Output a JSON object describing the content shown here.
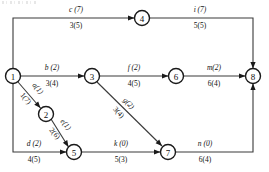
{
  "diagram": {
    "type": "activity-on-arrow-network",
    "title": "",
    "nodes": [
      {
        "id": "1",
        "label": "1",
        "cx": 13,
        "cy": 76,
        "r": 7.5
      },
      {
        "id": "2",
        "label": "2",
        "cx": 46,
        "cy": 114,
        "r": 7.5
      },
      {
        "id": "3",
        "label": "3",
        "cx": 92,
        "cy": 76,
        "r": 7.5
      },
      {
        "id": "4",
        "label": "4",
        "cx": 142,
        "cy": 18,
        "r": 7.5
      },
      {
        "id": "5",
        "label": "5",
        "cx": 74,
        "cy": 152,
        "r": 7.5
      },
      {
        "id": "6",
        "label": "6",
        "cx": 176,
        "cy": 76,
        "r": 7.5
      },
      {
        "id": "7",
        "label": "7",
        "cx": 168,
        "cy": 152,
        "r": 7.5
      },
      {
        "id": "8",
        "label": "8",
        "cx": 253,
        "cy": 76,
        "r": 7.5
      }
    ],
    "edges": [
      {
        "id": "c",
        "from": "1",
        "to": "4",
        "name": "c (7)",
        "duration": "3(5)",
        "name_x": 76,
        "name_y": 12,
        "dur_x": 76,
        "dur_y": 28,
        "rotate": 0,
        "path": "M 13 68.5 L 13 18 L 134.5 18",
        "arrow": {
          "x": 134.5,
          "y": 18,
          "angle": 0
        }
      },
      {
        "id": "i",
        "from": "4",
        "to": "8",
        "name": "i (7)",
        "duration": "5(5)",
        "name_x": 200,
        "name_y": 12,
        "dur_x": 200,
        "dur_y": 28,
        "rotate": 0,
        "path": "M 149.5 18 L 253 18 L 253 68.5",
        "arrow": {
          "x": 253,
          "y": 68.5,
          "angle": 90
        }
      },
      {
        "id": "b",
        "from": "1",
        "to": "3",
        "name": "b (2)",
        "duration": "3(4)",
        "name_x": 52,
        "name_y": 70,
        "dur_x": 52,
        "dur_y": 86,
        "rotate": 0,
        "path": "M 20.5 76 L 84.5 76",
        "arrow": {
          "x": 84.5,
          "y": 76,
          "angle": 0
        }
      },
      {
        "id": "f",
        "from": "3",
        "to": "6",
        "name": "f (2)",
        "duration": "4(5)",
        "name_x": 134,
        "name_y": 70,
        "dur_x": 134,
        "dur_y": 86,
        "rotate": 0,
        "path": "M 99.5 76 L 168.5 76",
        "arrow": {
          "x": 168.5,
          "y": 76,
          "angle": 0
        }
      },
      {
        "id": "m",
        "from": "6",
        "to": "8",
        "name": "m(2)",
        "duration": "6(4)",
        "name_x": 214,
        "name_y": 70,
        "dur_x": 214,
        "dur_y": 86,
        "rotate": 0,
        "path": "M 183.5 76 L 245.5 76",
        "arrow": {
          "x": 245.5,
          "y": 76,
          "angle": 0
        }
      },
      {
        "id": "a",
        "from": "1",
        "to": "2",
        "name": "a(1)",
        "duration": "1(7)",
        "name_x": 36,
        "name_y": 90,
        "dur_x": 24,
        "dur_y": 100,
        "rotate": 49,
        "path": "M 18 82 L 40.5 108",
        "arrow": {
          "x": 40.5,
          "y": 108,
          "angle": 49
        }
      },
      {
        "id": "e",
        "from": "2",
        "to": "5",
        "name": "e(1)",
        "duration": "2(6)",
        "name_x": 64,
        "name_y": 126,
        "dur_x": 53,
        "dur_y": 135,
        "rotate": 49,
        "path": "M 51 119 L 68.5 147",
        "arrow": {
          "x": 68.5,
          "y": 147,
          "angle": 58
        }
      },
      {
        "id": "d",
        "from": "1",
        "to": "5",
        "name": "d (2)",
        "duration": "4(5)",
        "name_x": 34,
        "name_y": 146,
        "dur_x": 34,
        "dur_y": 162,
        "rotate": 0,
        "path": "M 13 83.5 L 13 152 L 66.5 152",
        "arrow": {
          "x": 66.5,
          "y": 152,
          "angle": 0
        }
      },
      {
        "id": "k",
        "from": "5",
        "to": "7",
        "name": "k (0)",
        "duration": "5(3)",
        "name_x": 121,
        "name_y": 146,
        "dur_x": 121,
        "dur_y": 162,
        "rotate": 0,
        "path": "M 81.5 152 L 160.5 152",
        "arrow": {
          "x": 160.5,
          "y": 152,
          "angle": 0
        }
      },
      {
        "id": "g",
        "from": "3",
        "to": "7",
        "name": "g(2)",
        "duration": "3(4)",
        "name_x": 127,
        "name_y": 105,
        "dur_x": 117,
        "dur_y": 114,
        "rotate": 46,
        "path": "M 97 82 L 162 146",
        "arrow": {
          "x": 162,
          "y": 146,
          "angle": 45
        }
      },
      {
        "id": "n",
        "from": "7",
        "to": "8",
        "name": "n (0)",
        "duration": "6(4)",
        "name_x": 205,
        "name_y": 146,
        "dur_x": 205,
        "dur_y": 162,
        "rotate": 0,
        "path": "M 175.5 152 L 253 152 L 253 83.5",
        "arrow": {
          "x": 253,
          "y": 83.5,
          "angle": -90
        }
      }
    ],
    "colors": {
      "node_stroke": "#1a1a1a",
      "edge_stroke": "#3a3a3a",
      "text": "#111111",
      "background": "#ffffff"
    }
  }
}
